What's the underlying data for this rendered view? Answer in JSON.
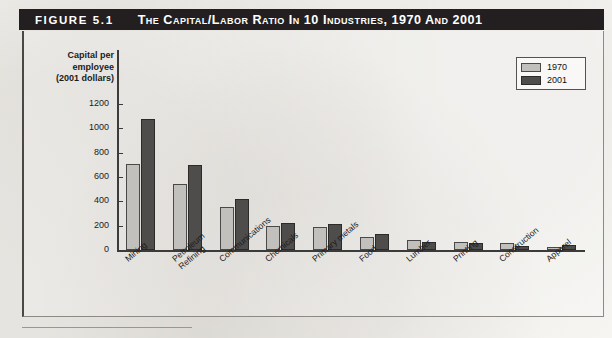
{
  "figure": {
    "number": "FIGURE 5.1",
    "title": "The Capital/Labor Ratio in 10 Industries, 1970 and 2001"
  },
  "chart_data": {
    "type": "bar",
    "title": "The Capital/Labor Ratio in 10 Industries, 1970 and 2001",
    "xlabel": "",
    "ylabel": "Capital per employee (2001 dollars)",
    "ylabel_lines": [
      "Capital per",
      "employee",
      "(2001 dollars)"
    ],
    "ylim": [
      0,
      1200
    ],
    "yticks": [
      0,
      200,
      400,
      600,
      800,
      1000,
      1200
    ],
    "ytick_labels": [
      "0",
      "200",
      "400",
      "600",
      "800",
      "1000",
      "1200"
    ],
    "grid": false,
    "legend_position": "top-right",
    "categories": [
      "Mining",
      "Petroleum Refining",
      "Communications",
      "Chemicals",
      "Primary metals",
      "Food",
      "Lumber",
      "Printing",
      "Construction",
      "Apparel"
    ],
    "category_label_lines": [
      [
        "Mining"
      ],
      [
        "Petroleum",
        "Refining"
      ],
      [
        "Communications"
      ],
      [
        "Chemicals"
      ],
      [
        "Primary metals"
      ],
      [
        "Food"
      ],
      [
        "Lumber"
      ],
      [
        "Printing"
      ],
      [
        "Construction"
      ],
      [
        "Apparel"
      ]
    ],
    "series": [
      {
        "name": "1970",
        "color": "#c2c0bd",
        "values": [
          710,
          540,
          355,
          200,
          190,
          105,
          80,
          62,
          58,
          22
        ]
      },
      {
        "name": "2001",
        "color": "#4f4d4c",
        "values": [
          1080,
          695,
          420,
          225,
          210,
          135,
          65,
          60,
          32,
          42
        ]
      }
    ]
  },
  "legend": {
    "entries": [
      {
        "label": "1970",
        "swatch": "light-gray"
      },
      {
        "label": "2001",
        "swatch": "dark-gray"
      }
    ]
  },
  "colors": {
    "title_bar_bg": "#231f20",
    "title_bar_text": "#ffffff",
    "series_1970": "#c2c0bd",
    "series_2001": "#4f4d4c",
    "axis": "#3b3b3b",
    "page_bg": "#f7f6f3"
  }
}
